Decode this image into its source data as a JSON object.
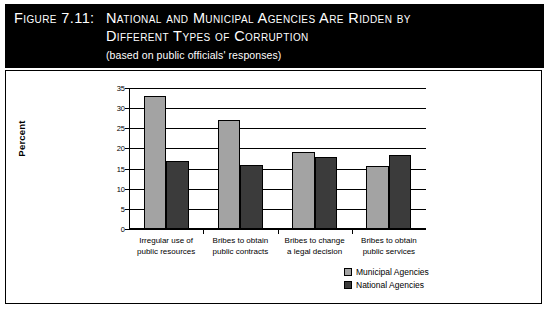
{
  "header": {
    "figure_label": "Figure 7.11:",
    "title_line_1": "National and Municipal Agencies Are Ridden by",
    "title_line_2": "Different Types of Corruption",
    "subtitle": "(based on public officials' responses)",
    "background_color": "#000000",
    "text_color": "#ffffff"
  },
  "chart_data": {
    "type": "bar",
    "title": "National and Municipal Agencies Are Ridden by Different Types of Corruption",
    "subtitle": "(based on public officials' responses)",
    "xlabel": "",
    "ylabel": "Percent",
    "ylim": [
      0,
      35
    ],
    "yticks": [
      0,
      5,
      10,
      15,
      20,
      25,
      30,
      35
    ],
    "grid": true,
    "legend_position": "bottom-right",
    "categories": [
      "Irregular use of public resources",
      "Bribes to obtain public contracts",
      "Bribes to change a legal decision",
      "Bribes to obtain public services"
    ],
    "category_lines": [
      [
        "Irregular use of",
        "public resources"
      ],
      [
        "Bribes to obtain",
        "public contracts"
      ],
      [
        "Bribes to change",
        "a legal decision"
      ],
      [
        "Bribes to obtain",
        "public services"
      ]
    ],
    "series": [
      {
        "name": "Municipal Agencies",
        "color": "#a3a3a3",
        "values": [
          33,
          27,
          19,
          15.7
        ]
      },
      {
        "name": "National Agencies",
        "color": "#3b3b3b",
        "values": [
          17,
          15.8,
          17.8,
          18.3
        ]
      }
    ]
  }
}
